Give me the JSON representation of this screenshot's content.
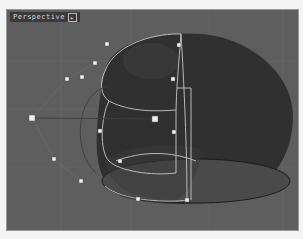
{
  "viewport": {
    "label": "Perspective",
    "dropdown_icon": "▸",
    "background_color": "#5e5e5e"
  },
  "scene": {
    "object": "rounded-lantern-surface",
    "surface_color": "#2f2f2f",
    "curve_color": "#c8c8c8",
    "control_point_color": "#f0f0f0",
    "control_points": [
      {
        "x": 106,
        "y": 43
      },
      {
        "x": 94,
        "y": 62
      },
      {
        "x": 81,
        "y": 76
      },
      {
        "x": 66,
        "y": 78
      },
      {
        "x": 178,
        "y": 44
      },
      {
        "x": 172,
        "y": 78
      },
      {
        "x": 31,
        "y": 117
      },
      {
        "x": 154,
        "y": 118
      },
      {
        "x": 99,
        "y": 130
      },
      {
        "x": 173,
        "y": 131
      },
      {
        "x": 53,
        "y": 158
      },
      {
        "x": 119,
        "y": 160
      },
      {
        "x": 80,
        "y": 180
      },
      {
        "x": 137,
        "y": 198
      },
      {
        "x": 186,
        "y": 199
      }
    ]
  }
}
